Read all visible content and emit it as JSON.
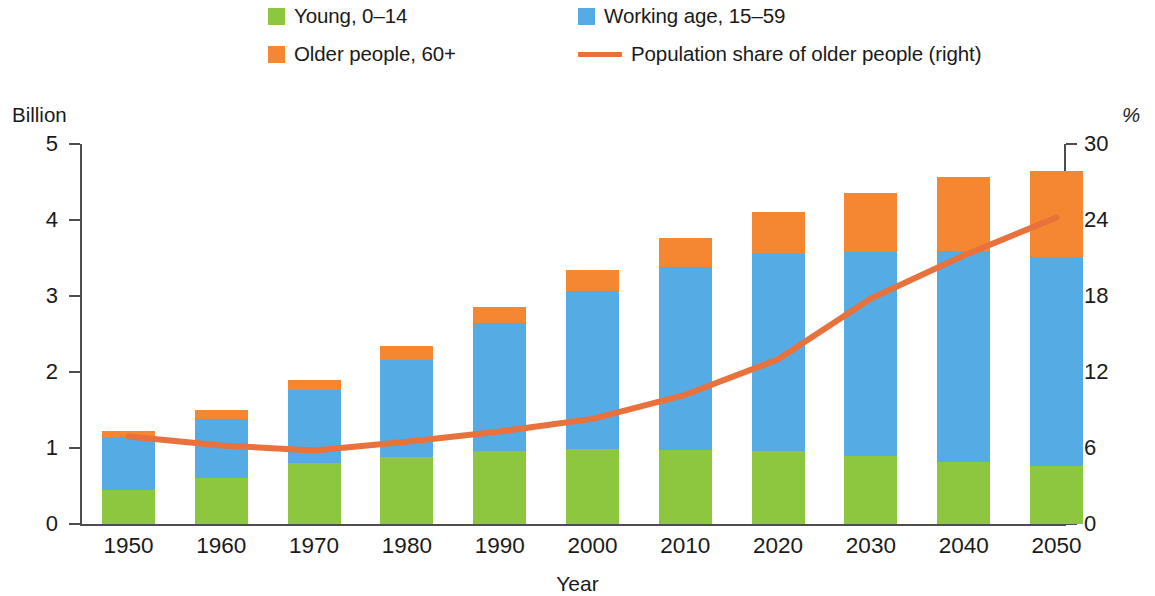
{
  "legend": {
    "items": [
      {
        "label": "Young, 0–14",
        "marker": "square",
        "color": "#8DC63F",
        "icon": "green-square-icon"
      },
      {
        "label": "Working age, 15–59",
        "marker": "square",
        "color": "#55ACE5",
        "icon": "blue-square-icon"
      },
      {
        "label": "Older people, 60+",
        "marker": "square",
        "color": "#F58733",
        "icon": "orange-square-icon"
      },
      {
        "label": "Population share of older people (right)",
        "marker": "line",
        "color": "#E8713C",
        "icon": "orange-line-icon"
      }
    ]
  },
  "axes": {
    "left_unit": "Billion",
    "right_unit": "%",
    "x_title": "Year"
  },
  "chart_data": {
    "type": "bar",
    "title": "",
    "subtitle": "",
    "xlabel": "Year",
    "ylabel": "Billion",
    "y2label": "%",
    "ylim": [
      0,
      5
    ],
    "y2lim": [
      0,
      30
    ],
    "yticks": [
      "0",
      "1",
      "2",
      "3",
      "4",
      "5"
    ],
    "y2ticks": [
      "0",
      "6",
      "12",
      "18",
      "24",
      "30"
    ],
    "grid": false,
    "stacked": true,
    "legend_position": "top",
    "categories": [
      "1950",
      "1960",
      "1970",
      "1980",
      "1990",
      "2000",
      "2010",
      "2020",
      "2030",
      "2040",
      "2050"
    ],
    "series": [
      {
        "name": "Young, 0–14",
        "axis": "left",
        "color": "#8DC63F",
        "values": [
          0.45,
          0.61,
          0.8,
          0.88,
          0.96,
          0.99,
          0.98,
          0.96,
          0.89,
          0.82,
          0.76
        ]
      },
      {
        "name": "Working age, 15–59",
        "axis": "left",
        "color": "#55ACE5",
        "values": [
          0.7,
          0.77,
          0.96,
          1.28,
          1.68,
          2.07,
          2.4,
          2.61,
          2.69,
          2.77,
          2.75
        ]
      },
      {
        "name": "Older people, 60+",
        "axis": "left",
        "color": "#F58733",
        "values": [
          0.08,
          0.12,
          0.14,
          0.18,
          0.21,
          0.28,
          0.38,
          0.54,
          0.78,
          0.97,
          1.13
        ]
      }
    ],
    "line_series": [
      {
        "name": "Population share of older people (right)",
        "type": "line",
        "axis": "right",
        "color": "#E8713C",
        "values": [
          6.9,
          6.2,
          5.8,
          6.5,
          7.3,
          8.3,
          10.2,
          13.0,
          17.8,
          21.2,
          24.2
        ]
      }
    ],
    "totals": [
      1.23,
      1.5,
      1.9,
      2.34,
      2.85,
      3.34,
      3.76,
      4.11,
      4.36,
      4.56,
      4.64
    ]
  }
}
